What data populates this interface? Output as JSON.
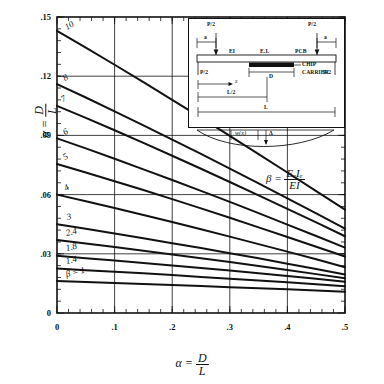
{
  "figure": {
    "kind": "engineering-design-chart",
    "ylabel_alpha": "α",
    "ylabel_eq": "=",
    "ylabel_num": "D",
    "ylabel_den": "L",
    "xlabel_alpha": "α",
    "xlabel_eq": "=",
    "xlabel_num": "D",
    "xlabel_den": "L"
  },
  "beta_formula": {
    "symbol": "β",
    "equals": "=",
    "numerator": "EₑIₑ",
    "denominator": "EI"
  },
  "inset": {
    "load_left_top": "P/2",
    "load_right_top": "P/2",
    "reaction_left": "P/2",
    "reaction_right": "P/2",
    "dim_a_left": "a",
    "dim_a_right": "a",
    "beam_stiffness": "EI",
    "chip_stiffness": "EₑIₑ",
    "pcb_label": "PCB",
    "chip_label_1": "CHIP",
    "chip_label_2": "CARRIER",
    "dim_D": "D",
    "dim_x": "x",
    "dim_L_half": "L/2",
    "dim_L": "L",
    "deflect_w": "w(x)",
    "deflect_delta": "Δ"
  },
  "chart_data": {
    "type": "line",
    "title": "",
    "xlabel": "α = D/L",
    "ylabel": "α = D/L",
    "xlim": [
      0,
      0.5
    ],
    "ylim": [
      0,
      0.15
    ],
    "xticks": [
      0,
      0.1,
      0.2,
      0.3,
      0.4,
      0.5
    ],
    "xticklabels": [
      "0",
      ".1",
      ".2",
      ".3",
      ".4",
      ".5"
    ],
    "yticks": [
      0,
      0.03,
      0.06,
      0.09,
      0.12,
      0.15
    ],
    "yticklabels": [
      "0",
      ".03",
      ".06",
      ".09",
      ".12",
      ".15"
    ],
    "minor_tick_count": 5,
    "grid": "major-only",
    "legend": "inline-curve-labels",
    "x": [
      0,
      0.05,
      0.1,
      0.15,
      0.2,
      0.25,
      0.3,
      0.35,
      0.4,
      0.45,
      0.5
    ],
    "series": [
      {
        "name": "10",
        "label": "10",
        "values": [
          0.143,
          0.1345,
          0.1258,
          0.117,
          0.108,
          0.099,
          0.0898,
          0.0805,
          0.0712,
          0.0618,
          0.0524
        ]
      },
      {
        "name": "8",
        "label": "8",
        "values": [
          0.116,
          0.1092,
          0.1022,
          0.0951,
          0.0879,
          0.0806,
          0.0732,
          0.0657,
          0.0581,
          0.0505,
          0.0428
        ]
      },
      {
        "name": "7",
        "label": "7",
        "values": [
          0.105,
          0.0989,
          0.0926,
          0.0862,
          0.0797,
          0.0731,
          0.0664,
          0.0596,
          0.0528,
          0.0459,
          0.0389
        ]
      },
      {
        "name": "6",
        "label": "6",
        "values": [
          0.0885,
          0.0834,
          0.0782,
          0.0728,
          0.0674,
          0.0619,
          0.0563,
          0.0506,
          0.0448,
          0.039,
          0.0331
        ]
      },
      {
        "name": "5",
        "label": "5",
        "values": [
          0.0755,
          0.0712,
          0.0668,
          0.0623,
          0.0577,
          0.053,
          0.0483,
          0.0434,
          0.0385,
          0.0336,
          0.0286
        ]
      },
      {
        "name": "4",
        "label": "4",
        "values": [
          0.06,
          0.0566,
          0.0532,
          0.0497,
          0.0461,
          0.0424,
          0.0387,
          0.0349,
          0.0311,
          0.0272,
          0.0232
        ]
      },
      {
        "name": "3",
        "label": "3",
        "values": [
          0.045,
          0.0427,
          0.0403,
          0.0379,
          0.0354,
          0.0329,
          0.0303,
          0.0277,
          0.025,
          0.0223,
          0.0195
        ]
      },
      {
        "name": "2.4",
        "label": "2.4",
        "values": [
          0.037,
          0.0352,
          0.0334,
          0.0316,
          0.0297,
          0.0278,
          0.0258,
          0.0238,
          0.0218,
          0.0197,
          0.0176
        ]
      },
      {
        "name": "1.8",
        "label": "1.8",
        "values": [
          0.029,
          0.0278,
          0.0266,
          0.0254,
          0.0241,
          0.0228,
          0.0215,
          0.0201,
          0.0187,
          0.0173,
          0.0158
        ]
      },
      {
        "name": "1.4",
        "label": "1.4",
        "values": [
          0.0225,
          0.0217,
          0.0209,
          0.0201,
          0.0192,
          0.0183,
          0.0174,
          0.0165,
          0.0156,
          0.0146,
          0.0136
        ]
      },
      {
        "name": "beta=1",
        "label": "β = 1",
        "values": [
          0.0162,
          0.0157,
          0.0152,
          0.0147,
          0.0142,
          0.0137,
          0.0131,
          0.0126,
          0.012,
          0.0114,
          0.0108
        ]
      }
    ]
  }
}
